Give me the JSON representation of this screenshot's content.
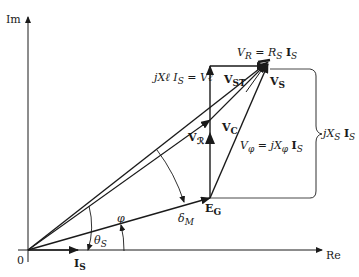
{
  "diagram": {
    "type": "phasor-diagram",
    "axes": {
      "im_label": "Im",
      "re_label": "Re",
      "origin_label": "0"
    },
    "labels": {
      "is_axis": "I",
      "is_axis_sub": "S",
      "eg": "E",
      "eg_sub": "G",
      "jxl": "jXℓ I",
      "jxl_sub": "S",
      "jxl_eq": "= Vℓ",
      "vst": "V",
      "vst_sub": "ST",
      "vr": "V",
      "vr_sub": "R",
      "vr_eq": "= R",
      "vr_eq_sub": "S",
      "vr_is": "I",
      "vr_is_sub": "S",
      "vs": "V",
      "vs_sub": "S",
      "vc": "V",
      "vc_sub": "C",
      "vphi": "V",
      "vphi_sub": "φ",
      "vphi_eq": "= jX",
      "vphi_eq_sub": "φ",
      "vphi_is": "I",
      "vphi_is_sub": "S",
      "vr_air": "V",
      "vr_air_sub": "ℛ",
      "bracket": "jX",
      "bracket_sub": "S",
      "bracket_is": "I",
      "bracket_is_sub": "S",
      "phi": "φ",
      "theta": "θ",
      "theta_sub": "S",
      "delta": "δ",
      "delta_sub": "M"
    },
    "colors": {
      "line": "#1a1a1a",
      "background": "#ffffff"
    }
  }
}
